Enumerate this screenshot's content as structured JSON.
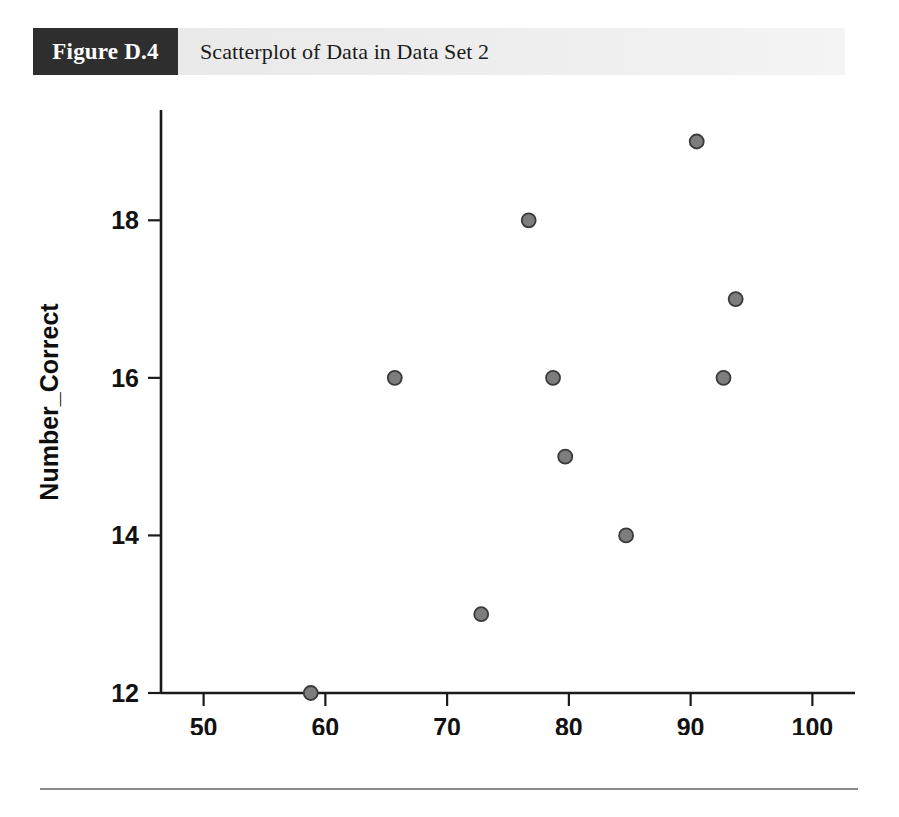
{
  "figure": {
    "number_label": "Figure D.4",
    "caption": "Scatterplot of Data in Data Set 2"
  },
  "chart_data": {
    "type": "scatter",
    "title": "Scatterplot of Data in Data Set 2",
    "xlabel": "Attitude",
    "ylabel": "Number_Correct",
    "xlim": [
      46.5,
      103.5
    ],
    "ylim": [
      12,
      19.4
    ],
    "xticks": [
      50,
      60,
      70,
      80,
      90,
      100
    ],
    "xtick_labels": [
      "50",
      "60",
      "70",
      "80",
      "90",
      "100"
    ],
    "yticks": [
      12,
      14,
      16,
      18
    ],
    "ytick_labels": [
      "12",
      "14",
      "16",
      "18"
    ],
    "grid": false,
    "legend": null,
    "marker": {
      "shape": "circle",
      "radius_px": 7,
      "fill": "#7d7d7d",
      "edge": "#3a3a3a"
    },
    "n_points": 10,
    "points": [
      {
        "x": 58.8,
        "y": 12
      },
      {
        "x": 65.7,
        "y": 16
      },
      {
        "x": 72.8,
        "y": 13
      },
      {
        "x": 76.7,
        "y": 18
      },
      {
        "x": 78.7,
        "y": 16
      },
      {
        "x": 79.7,
        "y": 15
      },
      {
        "x": 84.7,
        "y": 14
      },
      {
        "x": 90.5,
        "y": 19
      },
      {
        "x": 92.7,
        "y": 16
      },
      {
        "x": 93.7,
        "y": 17
      }
    ],
    "x": [
      58.8,
      65.7,
      72.8,
      76.7,
      78.7,
      79.7,
      84.7,
      90.5,
      92.7,
      93.7
    ],
    "values": [
      12,
      16,
      13,
      18,
      16,
      15,
      14,
      19,
      16,
      17
    ]
  },
  "colors": {
    "banner_dark": "#2e2e2e",
    "banner_light": "#ebebeb",
    "marker_fill": "#7d7d7d",
    "marker_edge": "#3a3a3a",
    "axis": "#1a1a1a",
    "footer_rule": "#8c8c8c"
  }
}
